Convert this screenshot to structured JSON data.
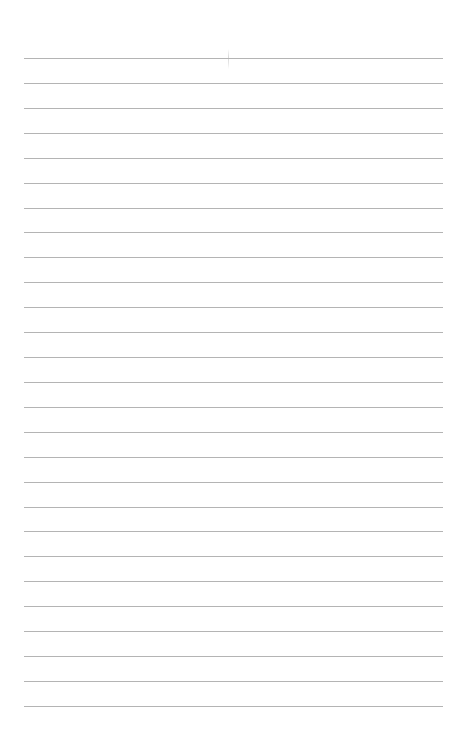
{
  "page": {
    "type": "lined-paper",
    "background_color": "#ffffff",
    "rule_color": "#b4b4b4",
    "rule_count": 27,
    "first_rule_y": 58,
    "rule_spacing": 24.92,
    "rule_left": 24,
    "rule_right": 443
  }
}
